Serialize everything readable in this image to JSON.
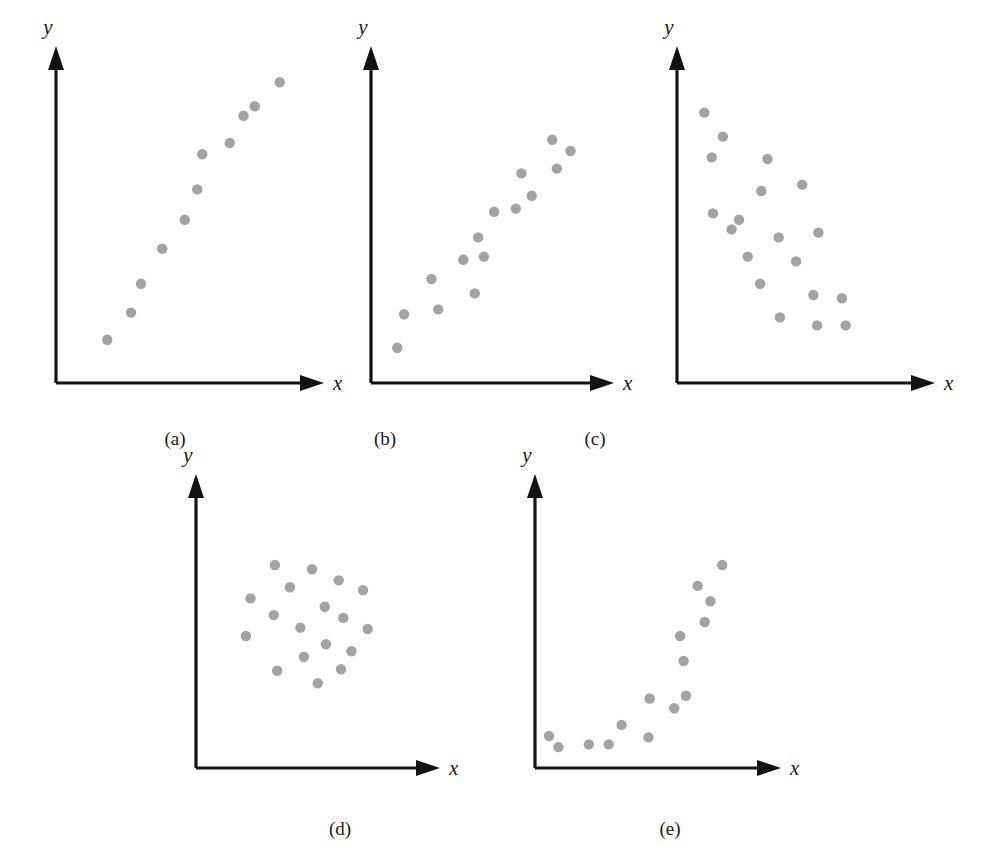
{
  "figure": {
    "kind": "multi-panel-scatterplot-figure",
    "background_color": "#ffffff",
    "dot_color": "#a3a3a3",
    "axis_color": "#131313",
    "cropped_top_text": "",
    "cropped_left_text": "",
    "panel_count": 5
  },
  "captions": {
    "a": "(a)",
    "b": "(b)",
    "c": "(c)",
    "d": "(d)",
    "e": "(e)"
  },
  "axis_labels": {
    "x": "x",
    "y": "y"
  },
  "chart_data": [
    {
      "id": "a",
      "type": "scatter",
      "title": "(a)",
      "xlabel": "x",
      "ylabel": "y",
      "pattern": "strong positive linear relationship",
      "grid": false,
      "legend": "none",
      "xlim": [
        0,
        100
      ],
      "ylim": [
        0,
        100
      ],
      "axis_ticks": [],
      "n_points": 11,
      "points": [
        {
          "x": 20.5,
          "y": 13.5
        },
        {
          "x": 30.0,
          "y": 22.0
        },
        {
          "x": 34.0,
          "y": 31.0
        },
        {
          "x": 42.5,
          "y": 42.0
        },
        {
          "x": 51.5,
          "y": 51.0
        },
        {
          "x": 56.5,
          "y": 60.5
        },
        {
          "x": 58.5,
          "y": 71.5
        },
        {
          "x": 69.5,
          "y": 75.0
        },
        {
          "x": 75.0,
          "y": 83.5
        },
        {
          "x": 79.5,
          "y": 86.5
        },
        {
          "x": 89.5,
          "y": 94.0
        }
      ]
    },
    {
      "id": "b",
      "type": "scatter",
      "title": "(b)",
      "xlabel": "x",
      "ylabel": "y",
      "pattern": "moderate positive linear relationship with scatter",
      "grid": false,
      "legend": "none",
      "xlim": [
        0,
        100
      ],
      "ylim": [
        0,
        100
      ],
      "axis_ticks": [],
      "n_points": 15,
      "points": [
        {
          "x": 11.5,
          "y": 11.0
        },
        {
          "x": 14.5,
          "y": 21.5
        },
        {
          "x": 29.5,
          "y": 23.0
        },
        {
          "x": 26.5,
          "y": 32.5
        },
        {
          "x": 45.5,
          "y": 28.0
        },
        {
          "x": 40.5,
          "y": 38.5
        },
        {
          "x": 49.5,
          "y": 39.5
        },
        {
          "x": 47.0,
          "y": 45.5
        },
        {
          "x": 54.0,
          "y": 53.5
        },
        {
          "x": 63.5,
          "y": 54.5
        },
        {
          "x": 70.5,
          "y": 58.5
        },
        {
          "x": 66.0,
          "y": 65.5
        },
        {
          "x": 81.5,
          "y": 67.0
        },
        {
          "x": 79.5,
          "y": 76.0
        },
        {
          "x": 87.5,
          "y": 72.5
        }
      ]
    },
    {
      "id": "c",
      "type": "scatter",
      "title": "(c)",
      "xlabel": "x",
      "ylabel": "y",
      "pattern": "moderate negative linear relationship with scatter",
      "grid": false,
      "legend": "none",
      "xlim": [
        0,
        100
      ],
      "ylim": [
        0,
        100
      ],
      "axis_ticks": [],
      "n_points": 19,
      "points": [
        {
          "x": 11.0,
          "y": 84.5
        },
        {
          "x": 18.5,
          "y": 77.0
        },
        {
          "x": 36.5,
          "y": 70.0
        },
        {
          "x": 14.0,
          "y": 70.5
        },
        {
          "x": 50.5,
          "y": 62.0
        },
        {
          "x": 34.0,
          "y": 60.0
        },
        {
          "x": 14.5,
          "y": 53.0
        },
        {
          "x": 25.0,
          "y": 51.0
        },
        {
          "x": 41.0,
          "y": 45.5
        },
        {
          "x": 57.0,
          "y": 47.0
        },
        {
          "x": 28.5,
          "y": 39.5
        },
        {
          "x": 48.0,
          "y": 38.0
        },
        {
          "x": 33.5,
          "y": 31.0
        },
        {
          "x": 55.0,
          "y": 27.5
        },
        {
          "x": 66.5,
          "y": 26.5
        },
        {
          "x": 41.5,
          "y": 20.5
        },
        {
          "x": 56.5,
          "y": 18.0
        },
        {
          "x": 68.0,
          "y": 18.0
        },
        {
          "x": 22.0,
          "y": 48.0
        }
      ]
    },
    {
      "id": "d",
      "type": "scatter",
      "title": "(d)",
      "xlabel": "x",
      "ylabel": "y",
      "pattern": "no relationship, circular cloud of points",
      "grid": false,
      "legend": "none",
      "xlim": [
        0,
        100
      ],
      "ylim": [
        0,
        100
      ],
      "axis_ticks": [],
      "n_points": 20,
      "points": [
        {
          "x": 34.0,
          "y": 73.0
        },
        {
          "x": 50.0,
          "y": 71.5
        },
        {
          "x": 61.5,
          "y": 67.5
        },
        {
          "x": 40.5,
          "y": 65.0
        },
        {
          "x": 72.0,
          "y": 64.0
        },
        {
          "x": 23.5,
          "y": 61.0
        },
        {
          "x": 55.5,
          "y": 58.0
        },
        {
          "x": 33.5,
          "y": 55.0
        },
        {
          "x": 63.5,
          "y": 54.0
        },
        {
          "x": 45.0,
          "y": 50.5
        },
        {
          "x": 74.0,
          "y": 50.0
        },
        {
          "x": 21.5,
          "y": 47.5
        },
        {
          "x": 56.0,
          "y": 44.5
        },
        {
          "x": 67.0,
          "y": 42.0
        },
        {
          "x": 46.5,
          "y": 40.0
        },
        {
          "x": 35.0,
          "y": 35.0
        },
        {
          "x": 62.5,
          "y": 35.5
        },
        {
          "x": 52.5,
          "y": 30.5
        }
      ]
    },
    {
      "id": "e",
      "type": "scatter",
      "title": "(e)",
      "xlabel": "x",
      "ylabel": "y",
      "pattern": "curvilinear (non-linear) relationship",
      "grid": false,
      "legend": "none",
      "xlim": [
        0,
        100
      ],
      "ylim": [
        0,
        100
      ],
      "axis_ticks": [],
      "n_points": 16,
      "points": [
        {
          "x": 6.0,
          "y": 11.5
        },
        {
          "x": 10.0,
          "y": 7.5
        },
        {
          "x": 23.0,
          "y": 8.5
        },
        {
          "x": 31.5,
          "y": 8.5
        },
        {
          "x": 37.0,
          "y": 15.5
        },
        {
          "x": 48.5,
          "y": 11.0
        },
        {
          "x": 49.0,
          "y": 25.0
        },
        {
          "x": 59.5,
          "y": 21.5
        },
        {
          "x": 64.5,
          "y": 26.0
        },
        {
          "x": 63.5,
          "y": 38.5
        },
        {
          "x": 62.0,
          "y": 47.5
        },
        {
          "x": 72.5,
          "y": 52.5
        },
        {
          "x": 75.0,
          "y": 60.0
        },
        {
          "x": 69.5,
          "y": 65.5
        },
        {
          "x": 80.0,
          "y": 73.0
        }
      ]
    }
  ]
}
